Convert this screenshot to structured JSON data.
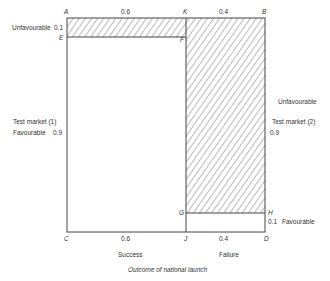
{
  "points": {
    "A": "A",
    "K": "K",
    "B": "B",
    "E": "E",
    "F": "F",
    "G": "G",
    "H": "H",
    "C": "C",
    "J": "J",
    "D": "D"
  },
  "top_axis": {
    "left_prob": "0.6",
    "right_prob": "0.4"
  },
  "bottom_axis": {
    "left_prob": "0.6",
    "right_prob": "0.4",
    "left_label": "Success",
    "right_label": "Failure"
  },
  "left_side": {
    "title": "Test market (1)",
    "unfavourable_label": "Unfavourable",
    "unfavourable_prob": "0.1",
    "favourable_label": "Favourable",
    "favourable_prob": "0.9"
  },
  "right_side": {
    "title": "Test market (2)",
    "unfavourable_label": "Unfavourable",
    "unfavourable_prob": "0.9",
    "favourable_label": "Favourable",
    "favourable_prob": "0.1"
  },
  "caption": "Outcome of national launch",
  "colors": {
    "line": "#444444",
    "hatch": "#555555",
    "background": "#ffffff"
  }
}
